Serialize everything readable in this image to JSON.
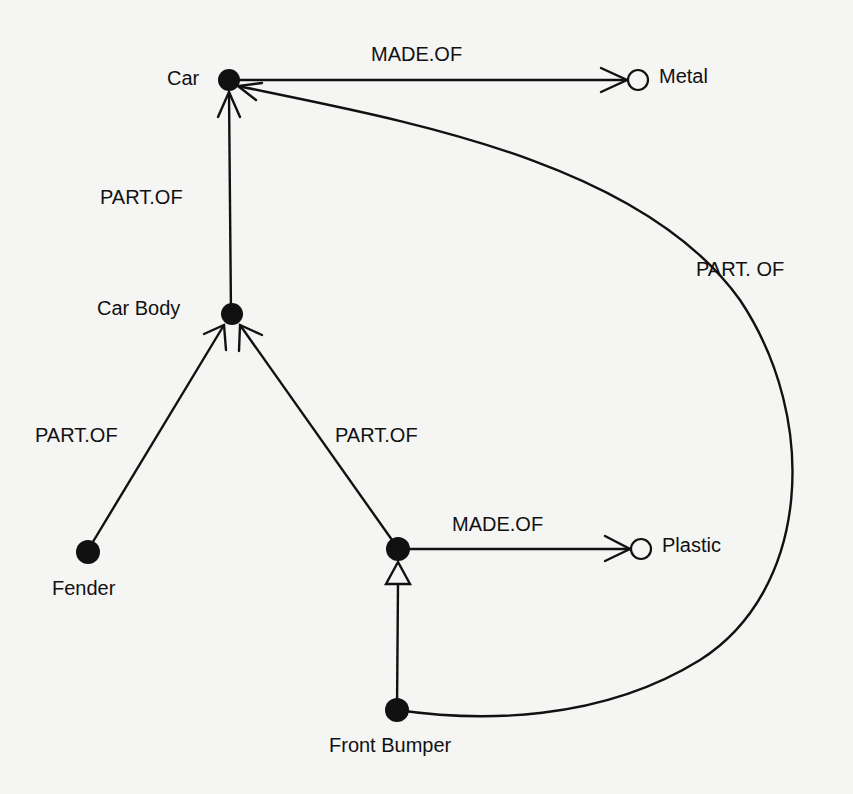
{
  "nodes": {
    "car": {
      "label": "Car",
      "type": "solid"
    },
    "metal": {
      "label": "Metal",
      "type": "hollow"
    },
    "car_body": {
      "label": "Car Body",
      "type": "solid"
    },
    "fender": {
      "label": "Fender",
      "type": "solid"
    },
    "bumper_mid": {
      "label": "",
      "type": "solid"
    },
    "plastic": {
      "label": "Plastic",
      "type": "hollow"
    },
    "front_bumper": {
      "label": "Front Bumper",
      "type": "solid"
    }
  },
  "edges": {
    "car_made_of_metal": {
      "label": "MADE.OF",
      "from": "Car",
      "to": "Metal"
    },
    "car_body_part_of_car": {
      "label": "PART.OF",
      "from": "Car Body",
      "to": "Car"
    },
    "fender_part_of_car_body": {
      "label": "PART.OF",
      "from": "Fender",
      "to": "Car Body"
    },
    "mid_part_of_car_body": {
      "label": "PART.OF",
      "from": "(unlabeled node)",
      "to": "Car Body"
    },
    "mid_made_of_plastic": {
      "label": "MADE.OF",
      "from": "(unlabeled node)",
      "to": "Plastic"
    },
    "front_bumper_isa_mid": {
      "label": "",
      "from": "Front Bumper",
      "to": "(unlabeled node)",
      "arrow": "hollow-triangle"
    },
    "front_bumper_part_of_car": {
      "label": "PART. OF",
      "from": "Front Bumper",
      "to": "Car"
    }
  },
  "colors": {
    "background": "#f5f5f4",
    "ink": "#111111"
  }
}
